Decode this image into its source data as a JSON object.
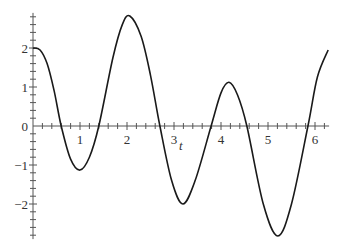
{
  "chart_data": {
    "type": "line",
    "title": "",
    "xlabel": "t",
    "ylabel": "",
    "xlim": [
      0,
      6.28
    ],
    "ylim": [
      -2.9,
      2.9
    ],
    "grid": false,
    "legend": null,
    "x_ticks": [
      1,
      2,
      3,
      4,
      5,
      6
    ],
    "y_ticks": [
      -2,
      -1,
      0,
      1,
      2
    ],
    "x_minor_step": 0.2,
    "y_minor_step": 0.2,
    "series": [
      {
        "name": "f(t)",
        "color": "#1a1a1a",
        "x": [
          0,
          0.15,
          0.3,
          0.45,
          0.6,
          0.8,
          1.0,
          1.2,
          1.4,
          1.7,
          1.9,
          2.06,
          2.3,
          2.5,
          2.7,
          2.95,
          3.19,
          3.45,
          3.79,
          4.0,
          4.17,
          4.35,
          4.55,
          4.9,
          5.21,
          5.5,
          5.85,
          6.05,
          6.28
        ],
        "values": [
          2.0,
          1.95,
          1.6,
          0.9,
          0.0,
          -0.85,
          -1.13,
          -0.8,
          0.0,
          1.75,
          2.6,
          2.82,
          2.3,
          1.3,
          0.0,
          -1.4,
          -2.0,
          -1.4,
          0.0,
          0.85,
          1.12,
          0.8,
          0.0,
          -2.0,
          -2.82,
          -2.0,
          0.0,
          1.25,
          1.95
        ]
      }
    ]
  },
  "labels": {
    "x_axis": "t",
    "x_ticks": [
      "1",
      "2",
      "3",
      "4",
      "5",
      "6"
    ],
    "y_ticks": [
      "2",
      "1",
      "0",
      "−1",
      "−2"
    ]
  }
}
